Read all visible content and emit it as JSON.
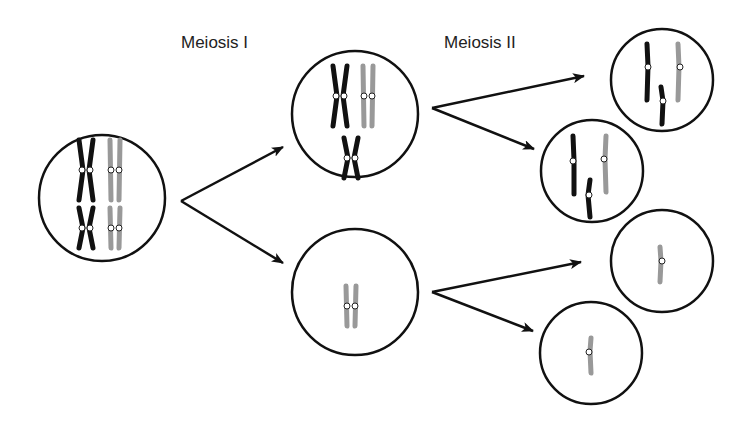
{
  "labels": {
    "meiosis1": "Meiosis I",
    "meiosis2": "Meiosis II"
  },
  "colors": {
    "dark_chromosome": "#111111",
    "light_chromosome": "#999999",
    "outline": "#111111",
    "background": "#ffffff"
  },
  "cells": [
    {
      "id": "parent",
      "stage": "start",
      "content": "2 dark X + 2 light X (large and small)"
    },
    {
      "id": "m1-top",
      "stage": "after meiosis I",
      "content": "2 dark X + 1 light X"
    },
    {
      "id": "m1-bottom",
      "stage": "after meiosis I",
      "content": "1 light X"
    },
    {
      "id": "m2-1",
      "stage": "after meiosis II",
      "content": "2 dark + 1 light single chromatid"
    },
    {
      "id": "m2-2",
      "stage": "after meiosis II",
      "content": "2 dark + 1 light single chromatid"
    },
    {
      "id": "m2-3",
      "stage": "after meiosis II",
      "content": "1 light single chromatid"
    },
    {
      "id": "m2-4",
      "stage": "after meiosis II",
      "content": "1 light single chromatid"
    }
  ]
}
